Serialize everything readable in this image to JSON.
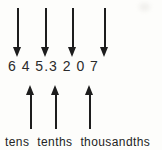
{
  "figure": {
    "number": "6 4 5.3 2 0 7",
    "place_labels": [
      "tens",
      "tenths",
      "thousandths"
    ],
    "icons": {
      "down_arrow": "↓",
      "up_arrow": "↑"
    },
    "colors": {
      "ink": "#1d1d1d",
      "digit_text": "#2b2b2b",
      "background": "#fdfdfb"
    }
  }
}
